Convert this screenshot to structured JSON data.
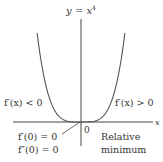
{
  "diagram": {
    "function_label": "y = x⁴",
    "function_label_parts": {
      "lhs": "y",
      "eq": " = ",
      "base": "x",
      "exp": "4"
    },
    "x_axis_label": "x",
    "origin_label": "0",
    "left_annotation": "f′(x) < 0",
    "right_annotation": "f′(x) > 0",
    "first_derivative_note": "f′(0) = 0",
    "second_derivative_note": "f″(0) = 0",
    "extremum_label_line1": "Relative",
    "extremum_label_line2": "minimum",
    "curve": {
      "function": "x^4",
      "x_range": [
        -1.33,
        1.33
      ]
    },
    "colors": {
      "curve": "#555555",
      "axes": "#444444",
      "text": "#333333"
    }
  }
}
